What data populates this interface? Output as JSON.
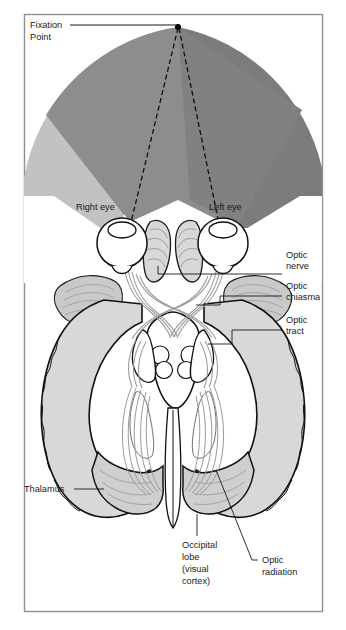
{
  "figure": {
    "frame_color": "#8a8a8a",
    "background": "#ffffff"
  },
  "visual_field": {
    "fixation_point_label_line1": "Fixation",
    "fixation_point_label_line2": "Point",
    "zones": [
      {
        "name": "left-peripheral-field",
        "color": "#c2c2c2"
      },
      {
        "name": "left-binocular-field",
        "color": "#8d8d8d"
      },
      {
        "name": "right-binocular-field",
        "color": "#8d8d8d"
      },
      {
        "name": "right-peripheral-field",
        "color": "#7c7c7c"
      }
    ],
    "fixation_dot_color": "#000000",
    "sight_line_style": "dashed"
  },
  "eyes": {
    "right_eye_label": "Right eye",
    "left_eye_label": "Left eye"
  },
  "labels": {
    "optic_nerve": "Optic\nnerve",
    "optic_nerve_l1": "Optic",
    "optic_nerve_l2": "nerve",
    "optic_chiasma_l1": "Optic",
    "optic_chiasma_l2": "chiasma",
    "optic_tract_l1": "Optic",
    "optic_tract_l2": "tract",
    "thalamus": "Thalamus",
    "occipital_l1": "Occipital",
    "occipital_l2": "lobe",
    "occipital_l3": "(visual",
    "occipital_l4": "cortex)",
    "optic_radiation_l1": "Optic",
    "optic_radiation_l2": "radiation"
  },
  "colors": {
    "brain_tissue": "#d8d8d8",
    "brain_outline": "#1a1a1a",
    "fiber": "#9a9a9a",
    "leader_line": "#1a1a1a",
    "text": "#1a1a1a"
  }
}
